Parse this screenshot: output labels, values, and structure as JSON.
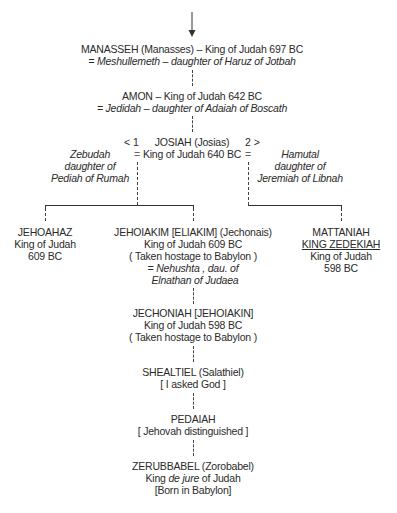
{
  "diagram": {
    "type": "genealogy-tree",
    "arrow": "down-arrow",
    "manasseh": {
      "name": "MANASSEH (Manasses) – King of Judah 697 BC",
      "spouse": "= Meshullemeth – daughter of Haruz of Jotbah"
    },
    "amon": {
      "name": "AMON – King of Judah 642 BC",
      "spouse": "= Jedidah – daughter of Adaiah of Boscath"
    },
    "josiah": {
      "name": "JOSIAH (Josias)",
      "title": "King of Judah 640 BC",
      "marriage1_marker": "< 1",
      "marriage2_marker": "2 >",
      "equals": "=",
      "wife1": [
        "Zebudah",
        "daughter of",
        "Pediah of Rumah"
      ],
      "wife2": [
        "Hamutal",
        "daughter of",
        "Jeremiah of Libnah"
      ]
    },
    "jehoahaz": {
      "name": "JEHOAHAZ",
      "title": "King of Judah",
      "date": "609 BC"
    },
    "jehoiakim": {
      "name": "JEHOIAKIM [ELIAKIM] (Jechonais)",
      "title": "King of Judah 609 BC",
      "note": "( Taken hostage to Babylon )",
      "spouse_line1": "= Nehushta , dau. of",
      "spouse_line2": "Elnathan of Judaea"
    },
    "mattaniah": {
      "name": "MATTANIAH",
      "regnal_name": "KING ZEDEKIAH",
      "title": "King of Judah",
      "date": "598 BC"
    },
    "jechoniah": {
      "name": "JECHONIAH [JEHOIAKIN]",
      "title": "King of Judah 598 BC",
      "note": "( Taken hostage to Babylon )"
    },
    "shealtiel": {
      "name": "SHEALTIEL (Salathiel)",
      "meaning": "[ I asked God ]"
    },
    "pedaiah": {
      "name": "PEDAIAH",
      "meaning": "[ Jehovah distinguished ]"
    },
    "zerubbabel": {
      "name": "ZERUBBABEL (Zorobabel)",
      "title_pre": "King ",
      "title_italic": "de jure",
      "title_post": " of Judah",
      "note": "[Born in Babylon]"
    }
  }
}
